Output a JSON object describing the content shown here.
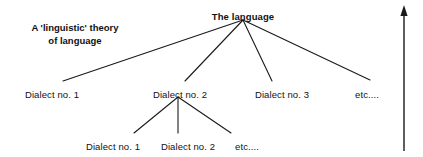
{
  "figure": {
    "caption": {
      "text": "A 'linguistic' theory\nof language",
      "x": 75,
      "y": 22
    },
    "arrow": {
      "label": "upward-arrow",
      "x": 404,
      "y_top": 5,
      "y_bottom": 151
    },
    "style": {
      "line_color": "#1a1a1a",
      "text_color": "#111111",
      "background": "#ffffff",
      "line_width": 1.1
    }
  },
  "chart_data": {
    "type": "diagram",
    "title": "A 'linguistic' theory of language",
    "nodes": [
      {
        "id": "root",
        "label": "The language",
        "x": 243,
        "y": 11,
        "level": 0,
        "bold": true
      },
      {
        "id": "d1",
        "label": "Dialect no. 1",
        "x": 52,
        "y": 89,
        "level": 1,
        "bold": false
      },
      {
        "id": "d2",
        "label": "Dialect no. 2",
        "x": 180,
        "y": 89,
        "level": 1,
        "bold": false
      },
      {
        "id": "d3",
        "label": "Dialect no. 3",
        "x": 282,
        "y": 89,
        "level": 1,
        "bold": false
      },
      {
        "id": "etc1",
        "label": "etc....",
        "x": 367,
        "y": 89,
        "level": 1,
        "bold": false
      },
      {
        "id": "d2d1",
        "label": "Dialect no. 1",
        "x": 113,
        "y": 141,
        "level": 2,
        "bold": false
      },
      {
        "id": "d2d2",
        "label": "Dialect no. 2",
        "x": 188,
        "y": 141,
        "level": 2,
        "bold": false
      },
      {
        "id": "etc2",
        "label": "etc....",
        "x": 247,
        "y": 141,
        "level": 2,
        "bold": false
      }
    ],
    "edges": [
      {
        "from": "root",
        "to": "d1",
        "x1": 243,
        "y1": 20,
        "x2": 63,
        "y2": 81
      },
      {
        "from": "root",
        "to": "d2",
        "x1": 243,
        "y1": 20,
        "x2": 185,
        "y2": 81
      },
      {
        "from": "root",
        "to": "d3",
        "x1": 243,
        "y1": 20,
        "x2": 272,
        "y2": 81
      },
      {
        "from": "root",
        "to": "etc1",
        "x1": 243,
        "y1": 20,
        "x2": 370,
        "y2": 80
      },
      {
        "from": "d2",
        "to": "d2d1",
        "x1": 178,
        "y1": 97,
        "x2": 134,
        "y2": 133
      },
      {
        "from": "d2",
        "to": "d2d2",
        "x1": 178,
        "y1": 97,
        "x2": 178,
        "y2": 133
      },
      {
        "from": "d2",
        "to": "etc2",
        "x1": 178,
        "y1": 97,
        "x2": 231,
        "y2": 133
      }
    ]
  }
}
